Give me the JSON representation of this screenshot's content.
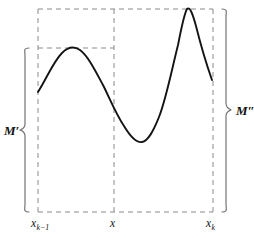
{
  "figure": {
    "kind": "oscillation-diagram",
    "width": 254,
    "height": 238,
    "background_color": "#ffffff",
    "curve_color": "#141414",
    "guide_color": "#8a8a8a",
    "brace_color": "#6f6f6f"
  },
  "labels": {
    "upper_bound_left": "M′",
    "upper_bound_right": "M″",
    "tick_left_base": "x",
    "tick_left_sub": "k−1",
    "tick_middle": "x",
    "tick_right_base": "x",
    "tick_right_sub": "k"
  },
  "chart_data": {
    "type": "line",
    "title": "",
    "xlabel": "",
    "ylabel": "",
    "grid": false,
    "legend": null,
    "axis_ticks": {
      "x": [
        "x_{k−1}",
        "x",
        "x_k"
      ],
      "x_pixel_positions": [
        38,
        114,
        213
      ],
      "y": [
        "M′",
        "M″"
      ]
    },
    "annotations": [
      {
        "text": "M′",
        "meaning": "supremum of f on [x_{k−1}, x]",
        "brace": "left",
        "brace_span_pixels": [
          48,
          212
        ]
      },
      {
        "text": "M″",
        "meaning": "supremum of f on [x_{k−1}, x_k]",
        "brace": "right",
        "brace_span_pixels": [
          9,
          212
        ]
      }
    ],
    "guide_rectangles": [
      {
        "name": "left-subinterval-box",
        "x0": 38,
        "x1": 114,
        "y_top": 48,
        "y_bottom": 212
      },
      {
        "name": "full-interval-box",
        "x0": 38,
        "x1": 213,
        "y_top": 9,
        "y_bottom": 212
      }
    ],
    "series": [
      {
        "name": "f(x)",
        "points": [
          [
            38,
            92
          ],
          [
            48,
            75
          ],
          [
            58,
            61
          ],
          [
            68,
            51
          ],
          [
            76,
            48
          ],
          [
            86,
            52
          ],
          [
            96,
            64
          ],
          [
            106,
            84
          ],
          [
            114,
            100
          ],
          [
            124,
            122
          ],
          [
            132,
            136
          ],
          [
            141,
            142
          ],
          [
            150,
            136
          ],
          [
            158,
            120
          ],
          [
            166,
            92
          ],
          [
            174,
            55
          ],
          [
            180,
            27
          ],
          [
            186,
            9
          ],
          [
            192,
            16
          ],
          [
            199,
            37
          ],
          [
            206,
            62
          ],
          [
            212,
            80
          ]
        ],
        "critical_points": [
          {
            "kind": "left-endpoint",
            "pixel": [
              38,
              92
            ]
          },
          {
            "kind": "local-maximum",
            "pixel": [
              76,
              48
            ],
            "note": "touches M′ level"
          },
          {
            "kind": "local-minimum",
            "pixel": [
              141,
              142
            ]
          },
          {
            "kind": "global-maximum",
            "pixel": [
              186,
              9
            ],
            "note": "touches M″ level"
          },
          {
            "kind": "right-endpoint",
            "pixel": [
              212,
              80
            ]
          }
        ]
      }
    ]
  },
  "geometry": {
    "curve_path": "M 38 92 C 47 78 53 62 62 53 C 68 47 74 46 80 50 C 88 56 95 70 103 85 C 110 99 116 114 124 126 C 130 136 136 143 142 142 C 148 141 153 132 159 117 C 166 99 171 73 178 45 C 181 30 184 14 187 9 C 190 6 193 15 196 26 C 200 42 206 63 212 80",
    "brace_left_path": "M 29 48 C 23 48 25 51 25 56 L 25 124 C 25 128 23 129 20 130 C 23 131 25 132 25 136 L 25 204 C 25 209 23 212 29 212",
    "brace_right_path": "M 222 9 C 228 9 226 12 226 17 L 226 103 C 226 107 228 108 231 110 C 228 111 226 112 226 116 L 226 204 C 226 209 228 212 222 212"
  }
}
